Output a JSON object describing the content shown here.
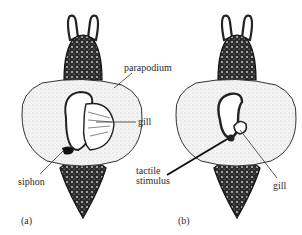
{
  "figure": {
    "panels": [
      {
        "id": "a",
        "label": "(a)",
        "callouts": {
          "parapodium": "parapodium",
          "gill": "gill",
          "siphon": "siphon"
        }
      },
      {
        "id": "b",
        "label": "(b)",
        "callouts": {
          "tactile_line1": "tactile",
          "tactile_line2": "stimulus",
          "gill": "gill"
        }
      }
    ]
  }
}
